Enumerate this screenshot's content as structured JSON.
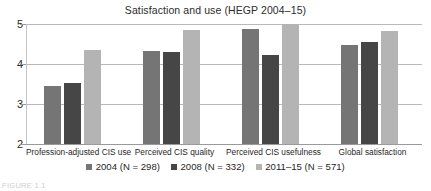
{
  "chart_data": {
    "type": "bar",
    "title": "Satisfaction and use (HEGP 2004–15)",
    "xlabel": "",
    "ylabel": "",
    "ylim": [
      2,
      5
    ],
    "yticks": [
      2,
      3,
      4,
      5
    ],
    "ytick_labels": [
      "2",
      "3",
      "4",
      "5"
    ],
    "grid": true,
    "legend_position": "bottom",
    "categories": [
      "Profession-adjusted CIS use",
      "Perceived CIS quality",
      "Perceived CIS usefulness",
      "Global satisfaction"
    ],
    "series": [
      {
        "name": "2004 (N = 298)",
        "color": "#757575",
        "values": [
          3.45,
          4.32,
          4.87,
          4.48
        ]
      },
      {
        "name": "2008 (N = 332)",
        "color": "#464646",
        "values": [
          3.52,
          4.29,
          4.22,
          4.56
        ]
      },
      {
        "name": "2011–15 (N = 571)",
        "color": "#b4b4b4",
        "values": [
          4.35,
          4.86,
          5.0,
          4.83
        ]
      }
    ]
  },
  "page": {
    "caption_fragment": "FIGURE 1.1"
  }
}
